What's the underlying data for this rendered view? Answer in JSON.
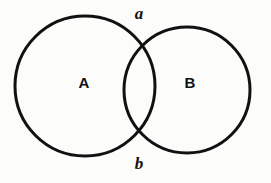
{
  "figure": {
    "type": "venn-two-circles",
    "background_color": "#fcfcfa",
    "stroke_color": "#111111",
    "stroke_width": 3,
    "canvas": {
      "width": 271,
      "height": 183
    }
  },
  "circles": [
    {
      "id": "circle-A",
      "label": "A",
      "cx": 85,
      "cy": 86,
      "r": 70,
      "fill": "none"
    },
    {
      "id": "circle-B",
      "label": "B",
      "cx": 187,
      "cy": 90,
      "r": 63,
      "fill": "none"
    }
  ],
  "region_labels": [
    {
      "id": "label-A",
      "text": "A",
      "x": 84,
      "y": 82
    },
    {
      "id": "label-B",
      "text": "B",
      "x": 190,
      "y": 82
    }
  ],
  "point_labels": [
    {
      "id": "label-a",
      "text": "a",
      "x": 139,
      "y": 13
    },
    {
      "id": "label-b",
      "text": "b",
      "x": 139,
      "y": 163
    }
  ],
  "intersection_points": [
    {
      "id": "point-a",
      "name": "upper-intersection",
      "x": 137,
      "y": 30
    },
    {
      "id": "point-b",
      "name": "lower-intersection",
      "x": 138,
      "y": 143
    }
  ]
}
